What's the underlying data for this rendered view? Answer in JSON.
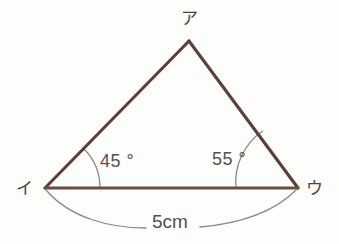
{
  "figure": {
    "type": "triangle-geometry-diagram",
    "background_color": "#fdfdfc",
    "stroke_color": "#5a4038",
    "thin_stroke_color": "#8d8781",
    "text_color": "#56504c",
    "vertices": [
      {
        "id": "apex",
        "label": "ア",
        "x": 189,
        "y": 41
      },
      {
        "id": "left",
        "label": "イ",
        "x": 45,
        "y": 188
      },
      {
        "id": "right",
        "label": "ウ",
        "x": 298,
        "y": 188
      }
    ],
    "angles": [
      {
        "id": "angle-left",
        "label": "45 °",
        "value": 45,
        "unit": "degree",
        "at_vertex": "left"
      },
      {
        "id": "angle-right",
        "label": "55 °",
        "value": 55,
        "unit": "degree",
        "at_vertex": "right"
      }
    ],
    "measurements": [
      {
        "id": "base-length",
        "label": "5cm",
        "value": 5,
        "unit": "cm",
        "from": "left",
        "to": "right"
      }
    ]
  }
}
